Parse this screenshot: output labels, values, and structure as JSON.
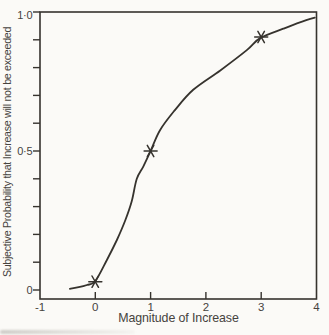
{
  "figure": {
    "background": "#fbfaf7",
    "ink_color": "#36332e",
    "text_color": "#46433e"
  },
  "chart_data": {
    "type": "line",
    "title": "",
    "xlabel": "Magnitude of Increase",
    "ylabel": "Subjective Probability that Increase will not be exceeded",
    "xlim": [
      -1,
      4
    ],
    "ylim": [
      0,
      1
    ],
    "grid": false,
    "frame": "box",
    "legend": "none",
    "x_ticks": [
      {
        "v": -1,
        "label": "-1",
        "mark": false
      },
      {
        "v": 0,
        "label": "0",
        "mark": true
      },
      {
        "v": 1,
        "label": "1",
        "mark": true
      },
      {
        "v": 2,
        "label": "2",
        "mark": true
      },
      {
        "v": 3,
        "label": "3",
        "mark": true
      },
      {
        "v": 4,
        "label": "4",
        "mark": false
      }
    ],
    "y_ticks_labeled": [
      {
        "v": 0,
        "label": "0"
      },
      {
        "v": 0.5,
        "label": "0·5"
      },
      {
        "v": 1,
        "label": "1·0"
      }
    ],
    "y_minor_ticks": [
      0.1,
      0.2,
      0.3,
      0.4,
      0.6,
      0.7,
      0.8,
      0.9
    ],
    "series": [
      {
        "name": "fitted-subjective-probability-curve",
        "type": "line",
        "points": [
          [
            -0.46,
            0.004
          ],
          [
            -0.3,
            0.01
          ],
          [
            -0.15,
            0.018
          ],
          [
            0.0,
            0.032
          ],
          [
            0.21,
            0.108
          ],
          [
            0.39,
            0.18
          ],
          [
            0.54,
            0.25
          ],
          [
            0.66,
            0.32
          ],
          [
            0.75,
            0.4
          ],
          [
            0.87,
            0.445
          ],
          [
            1.0,
            0.5
          ],
          [
            1.17,
            0.575
          ],
          [
            1.44,
            0.647
          ],
          [
            1.77,
            0.72
          ],
          [
            2.26,
            0.79
          ],
          [
            2.74,
            0.863
          ],
          [
            2.98,
            0.906
          ],
          [
            3.4,
            0.94
          ],
          [
            3.7,
            0.963
          ],
          [
            3.97,
            0.98
          ]
        ]
      },
      {
        "name": "assessed-probability-points",
        "type": "scatter",
        "marker": "asterisk",
        "points": [
          [
            0,
            0.03
          ],
          [
            1,
            0.5
          ],
          [
            3,
            0.91
          ]
        ]
      }
    ]
  }
}
